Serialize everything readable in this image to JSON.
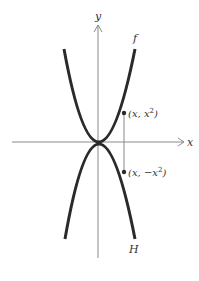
{
  "diagram": {
    "title": "",
    "axes": {
      "x_label": "x",
      "y_label": "y"
    },
    "curves": [
      {
        "name": "f",
        "label": "f",
        "equation": "y = x^2",
        "opens": "up"
      },
      {
        "name": "H",
        "label": "H",
        "equation": "y = -x^2",
        "opens": "down"
      }
    ],
    "points": [
      {
        "label": "(x, x²)",
        "label_base": "(x, x",
        "label_sup": "2",
        "label_end": ")"
      },
      {
        "label": "(x, −x²)",
        "label_base": "(x, −x",
        "label_sup": "2",
        "label_end": ")"
      }
    ],
    "colors": {
      "curve": "#2a2a2a",
      "axis": "#8a8a8a",
      "text": "#333333"
    }
  }
}
